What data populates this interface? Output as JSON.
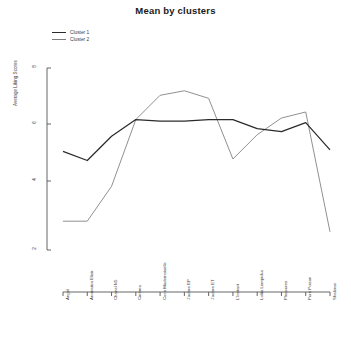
{
  "chart_data": {
    "type": "line",
    "title": "Mean by clusters",
    "xlabel": "",
    "ylabel": "Average Liking Scores",
    "ylim": [
      2,
      8
    ],
    "yticks": [
      8,
      6,
      4,
      2
    ],
    "grid": false,
    "legend_position": "top-left",
    "categories": [
      "Angel",
      "Aromatics Elixir",
      "Chanel N5",
      "Cinéma",
      "Coco Mademoiselle",
      "J'adore EP",
      "J'adore ET",
      "L'Instant",
      "Lolita Lempicka",
      "Pleasures",
      "Pure Poison",
      "Shalimar"
    ],
    "series": [
      {
        "name": "Cluster 1",
        "color": "#2b2b2b",
        "values": [
          5.25,
          4.95,
          5.75,
          6.3,
          6.25,
          6.25,
          6.3,
          6.3,
          6.0,
          5.9,
          6.2,
          5.3
        ]
      },
      {
        "name": "Cluster 2",
        "color": "#7c7c7c",
        "values": [
          2.95,
          2.95,
          4.1,
          6.3,
          7.1,
          7.25,
          7.0,
          5.0,
          5.8,
          6.35,
          6.55,
          2.6
        ]
      }
    ]
  },
  "legend": {
    "items": [
      {
        "label": "Cluster 1"
      },
      {
        "label": "Cluster 2"
      }
    ]
  }
}
